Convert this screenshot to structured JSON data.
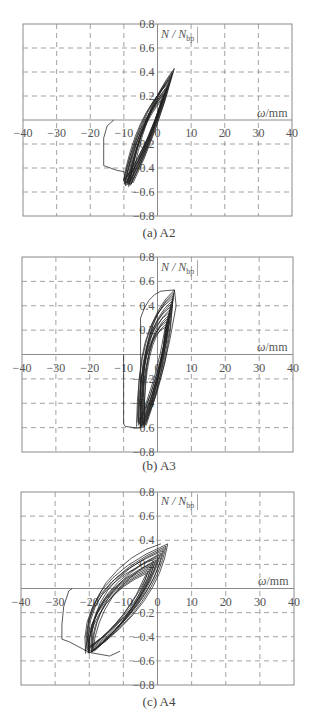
{
  "chart_data": [
    {
      "type": "line",
      "title": "(a) A2",
      "xlabel": "ω/mm",
      "ylabel": "N/N_bp",
      "xlim": [
        -40,
        40
      ],
      "ylim": [
        -0.8,
        0.8
      ],
      "grid": true,
      "xticks": [
        -40,
        -30,
        -20,
        -10,
        0,
        10,
        20,
        30,
        40
      ],
      "yticks": [
        0.8,
        0.6,
        0.4,
        0.2,
        -0.2,
        -0.4,
        -0.6,
        -0.8
      ],
      "series": [
        {
          "name": "initial branch",
          "x": [
            -13,
            -15,
            -16,
            -16,
            -15,
            -12,
            -10,
            -9.5
          ],
          "y": [
            0,
            -0.05,
            -0.15,
            -0.38,
            -0.39,
            -0.42,
            -0.43,
            -0.55
          ]
        },
        {
          "name": "hysteresis loops",
          "peak": [
            5,
            0.43
          ],
          "trough": [
            -9,
            -0.55
          ]
        }
      ]
    },
    {
      "type": "line",
      "title": "(b) A3",
      "xlabel": "ω/mm",
      "ylabel": "N/N_bp",
      "xlim": [
        -40,
        40
      ],
      "ylim": [
        -0.8,
        0.8
      ],
      "grid": true,
      "xticks": [
        -40,
        -30,
        -20,
        -10,
        0,
        10,
        20,
        30,
        40
      ],
      "yticks": [
        0.8,
        0.6,
        0.4,
        0.2,
        -0.2,
        -0.4,
        -0.6,
        -0.8
      ],
      "series": [
        {
          "name": "initial branch",
          "x": [
            -10,
            -10,
            -9.5,
            -7,
            -5
          ],
          "y": [
            0,
            -0.57,
            -0.59,
            -0.6,
            -0.6
          ]
        },
        {
          "name": "hysteresis loops",
          "peak": [
            5,
            0.53
          ],
          "trough": [
            -5,
            -0.6
          ]
        }
      ]
    },
    {
      "type": "line",
      "title": "(c) A4",
      "xlabel": "ω/mm",
      "ylabel": "N/N_bp",
      "xlim": [
        -40,
        40
      ],
      "ylim": [
        -0.8,
        0.8
      ],
      "grid": true,
      "xticks": [
        -40,
        -30,
        -20,
        -10,
        0,
        10,
        20,
        30,
        40
      ],
      "yticks": [
        0.8,
        0.6,
        0.4,
        0.2,
        -0.2,
        -0.4,
        -0.6,
        -0.8
      ],
      "series": [
        {
          "name": "initial branch",
          "x": [
            -25,
            -26,
            -27.5,
            -28,
            -28,
            -26,
            -20
          ],
          "y": [
            0,
            -0.02,
            -0.15,
            -0.3,
            -0.42,
            -0.44,
            -0.53
          ]
        },
        {
          "name": "hysteresis loops",
          "peak": [
            3,
            0.37
          ],
          "trough": [
            -20,
            -0.53
          ]
        }
      ]
    }
  ],
  "panels": [
    {
      "caption": "(a) A2",
      "ylabel_main": "N / N",
      "ylabel_sub": "bp",
      "xlabel_sym": "ω",
      "xlabel_unit": "/mm"
    },
    {
      "caption": "(b) A3",
      "ylabel_main": "N / N",
      "ylabel_sub": "bp",
      "xlabel_sym": "ω",
      "xlabel_unit": "/mm"
    },
    {
      "caption": "(c) A4",
      "ylabel_main": "N / N",
      "ylabel_sub": "bp",
      "xlabel_sym": "ω",
      "xlabel_unit": "/mm"
    }
  ],
  "tick_labels": {
    "x": [
      "-40",
      "-30",
      "-20",
      "-10",
      "0",
      "10",
      "20",
      "30",
      "40"
    ],
    "y": [
      "0.8",
      "0.6",
      "0.4",
      "0.2",
      "0.2",
      "0.4",
      "0.6",
      "0.8"
    ]
  }
}
